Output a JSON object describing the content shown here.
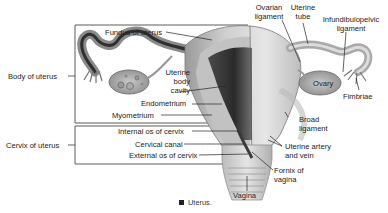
{
  "figure": {
    "caption_marker": "square",
    "caption": "Uterus.",
    "group_labels": {
      "body": "Body of uterus",
      "cervix": "Cervix of uterus"
    },
    "left_labels": {
      "fundus": "Fundus of uterus",
      "body_cavity_1": "Uterine",
      "body_cavity_2": "body",
      "body_cavity_3": "cavity",
      "endometrium": "Endometrium",
      "myometrium": "Myometrium",
      "internal_os": "Internal os of cervix",
      "cervical_canal": "Cervical canal",
      "external_os": "External os of cervix"
    },
    "top_labels": {
      "ovarian_ligament_1": "Ovarian",
      "ovarian_ligament_2": "ligament",
      "uterine_tube_1": "Uterine",
      "uterine_tube_2": "tube",
      "infundibulopelvic_1": "Infundibulopelvic",
      "infundibulopelvic_2": "ligament"
    },
    "right_labels": {
      "ovary": "Ovary",
      "fimbriae": "Fimbriae",
      "broad_ligament_1": "Broad",
      "broad_ligament_2": "ligament",
      "uterine_vessels_1": "Uterine artery",
      "uterine_vessels_2": "and vein",
      "fornix_1": "Fornix of",
      "fornix_2": "vagina",
      "vagina": "Vagina"
    }
  }
}
